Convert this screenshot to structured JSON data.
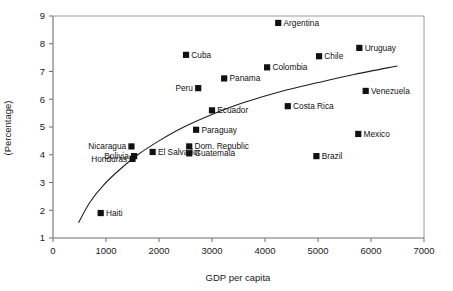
{
  "chart_data": {
    "type": "scatter",
    "title": "",
    "subtitle": "",
    "xlabel": "GDP per capita",
    "ylabel": "(Percentage)",
    "xlim": [
      0,
      7000
    ],
    "ylim": [
      1,
      9
    ],
    "xticks": [
      0,
      1000,
      2000,
      3000,
      4000,
      5000,
      6000,
      7000
    ],
    "xtick_labels": [
      "0",
      "1000",
      "2000",
      "3000",
      "4000",
      "5000",
      "6000",
      "7000"
    ],
    "yticks": [
      1,
      2,
      3,
      4,
      5,
      6,
      7,
      8,
      9
    ],
    "ytick_labels": [
      "1",
      "2",
      "3",
      "4",
      "5",
      "6",
      "7",
      "8",
      "9"
    ],
    "grid": false,
    "legend": "none",
    "marker_shape": "square",
    "marker_color": "#111111",
    "points": [
      {
        "label": "Argentina",
        "x": 4250,
        "y": 8.75,
        "label_side": "right"
      },
      {
        "label": "Uruguay",
        "x": 5780,
        "y": 7.85,
        "label_side": "right"
      },
      {
        "label": "Cuba",
        "x": 2510,
        "y": 7.6,
        "label_side": "right"
      },
      {
        "label": "Chile",
        "x": 5020,
        "y": 7.55,
        "label_side": "right"
      },
      {
        "label": "Colombia",
        "x": 4040,
        "y": 7.15,
        "label_side": "right"
      },
      {
        "label": "Panama",
        "x": 3230,
        "y": 6.75,
        "label_side": "right"
      },
      {
        "label": "Peru",
        "x": 2740,
        "y": 6.4,
        "label_side": "left"
      },
      {
        "label": "Venezuela",
        "x": 5900,
        "y": 6.3,
        "label_side": "right"
      },
      {
        "label": "Costa Rica",
        "x": 4430,
        "y": 5.75,
        "label_side": "right"
      },
      {
        "label": "Ecuador",
        "x": 3000,
        "y": 5.6,
        "label_side": "right"
      },
      {
        "label": "Paraguay",
        "x": 2700,
        "y": 4.9,
        "label_side": "right"
      },
      {
        "label": "Mexico",
        "x": 5760,
        "y": 4.75,
        "label_side": "right"
      },
      {
        "label": "Nicaragua",
        "x": 1480,
        "y": 4.3,
        "label_side": "left"
      },
      {
        "label": "Dom. Republic",
        "x": 2570,
        "y": 4.3,
        "label_side": "right"
      },
      {
        "label": "El Salvador",
        "x": 1880,
        "y": 4.1,
        "label_side": "right"
      },
      {
        "label": "Guatemala",
        "x": 2570,
        "y": 4.05,
        "label_side": "right"
      },
      {
        "label": "Bolivia",
        "x": 1530,
        "y": 3.95,
        "label_side": "left"
      },
      {
        "label": "Brazil",
        "x": 4970,
        "y": 3.95,
        "label_side": "right"
      },
      {
        "label": "Honduras",
        "x": 1500,
        "y": 3.85,
        "label_side": "left"
      },
      {
        "label": "Haiti",
        "x": 900,
        "y": 1.9,
        "label_side": "right"
      }
    ],
    "trend_line": {
      "description": "logarithmic fit curve",
      "points": [
        {
          "x": 480,
          "y": 1.55
        },
        {
          "x": 700,
          "y": 2.3
        },
        {
          "x": 950,
          "y": 2.9
        },
        {
          "x": 1250,
          "y": 3.45
        },
        {
          "x": 1600,
          "y": 4.0
        },
        {
          "x": 2000,
          "y": 4.5
        },
        {
          "x": 2450,
          "y": 4.98
        },
        {
          "x": 3000,
          "y": 5.45
        },
        {
          "x": 3600,
          "y": 5.88
        },
        {
          "x": 4300,
          "y": 6.28
        },
        {
          "x": 5000,
          "y": 6.6
        },
        {
          "x": 5700,
          "y": 6.9
        },
        {
          "x": 6500,
          "y": 7.2
        }
      ]
    }
  }
}
